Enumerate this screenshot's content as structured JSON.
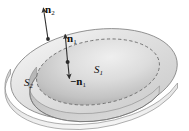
{
  "figure": {
    "background_color": "#ffffff",
    "width": 189,
    "height": 131
  },
  "labels": {
    "n2": {
      "symbol": "n",
      "subscript": "2",
      "text": "n"
    },
    "n1": {
      "symbol": "n",
      "subscript": "1",
      "text": "n"
    },
    "minus_n1": {
      "symbol": "−n",
      "subscript": "1",
      "text": "−n"
    },
    "s1": {
      "symbol": "S",
      "subscript": "1",
      "text": "S"
    },
    "s2": {
      "symbol": "S",
      "subscript": "2",
      "text": "S"
    }
  },
  "colors": {
    "outline": "#7a7a7a",
    "outer_surface_light": "#f2f2f2",
    "outer_surface_mid": "#d9d9d9",
    "outer_surface_dark": "#bfbfbf",
    "inner_surface_light": "#ececec",
    "inner_surface_mid": "#cfcfcf",
    "inner_surface_dark": "#b0b0b0",
    "arrow": "#3a3a3a",
    "text": "#111111",
    "dashed_rim": "#8c8c8c"
  },
  "geometry": {
    "outer_ellipse": {
      "cx": 94,
      "cy": 74,
      "rx": 84,
      "ry": 44,
      "rotation_deg": -9
    },
    "inner_ellipse": {
      "cx": 98,
      "cy": 72,
      "rx": 62,
      "ry": 32,
      "rotation_deg": -9
    },
    "inner_bowl_depth": 14,
    "outer_rim_thickness": 5
  },
  "vectors": {
    "n2": {
      "tail_x": 48,
      "tail_y": 39,
      "head_x": 43,
      "head_y": 5,
      "label": "n2"
    },
    "n1": {
      "tail_x": 68,
      "tail_y": 62,
      "head_x": 65,
      "head_y": 32,
      "label": "n1"
    },
    "minus_n1": {
      "tail_x": 68,
      "tail_y": 62,
      "head_x": 70,
      "head_y": 80,
      "label": "minus_n1"
    }
  }
}
